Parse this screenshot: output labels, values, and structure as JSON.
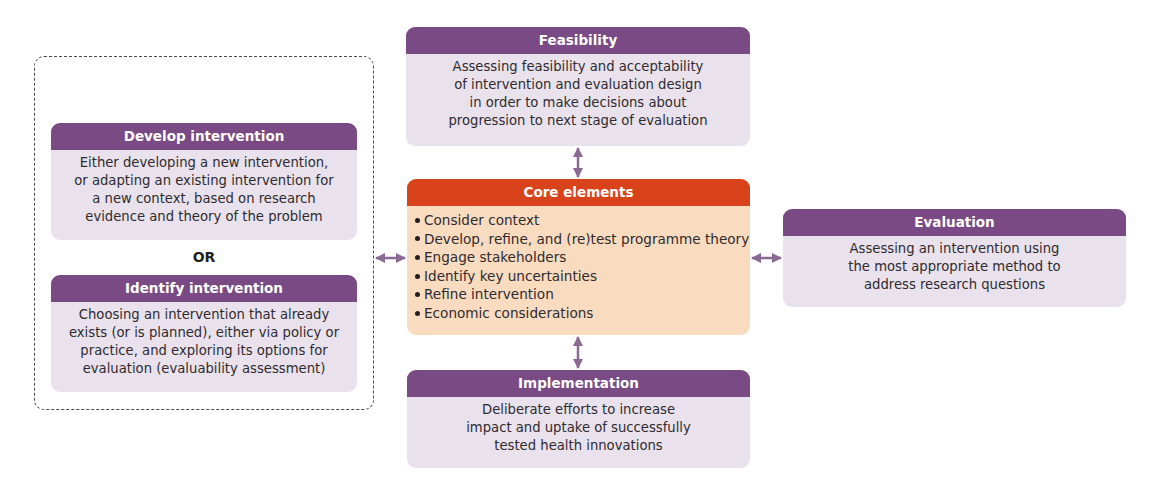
{
  "diagram": {
    "colors": {
      "header_purple": "#7a4a84",
      "box_lilac": "#e9e2ec",
      "core_header_orange": "#d9431c",
      "core_body_peach": "#f9dcc0",
      "arrow_purple": "#8a6a93",
      "dashed_border": "#4a4a4a"
    },
    "feasibility": {
      "title": "Feasibility",
      "lines": [
        "Assessing feasibility and acceptability",
        "of intervention and evaluation design",
        "in order to make decisions about",
        "progression to next stage of evaluation"
      ]
    },
    "develop": {
      "title": "Develop intervention",
      "lines": [
        "Either developing a new intervention,",
        "or adapting an existing intervention for",
        "a new context, based on research",
        "evidence and theory of the problem"
      ]
    },
    "or_label": "OR",
    "identify": {
      "title": "Identify intervention",
      "lines": [
        "Choosing an intervention that already",
        "exists (or is planned), either via policy or",
        "practice, and exploring its options for",
        "evaluation (evaluability assessment)"
      ]
    },
    "core": {
      "title": "Core elements",
      "items": [
        "Consider context",
        "Develop, refine, and (re)test programme theory",
        "Engage stakeholders",
        "Identify key uncertainties",
        "Refine intervention",
        "Economic considerations"
      ]
    },
    "evaluation": {
      "title": "Evaluation",
      "lines": [
        "Assessing an intervention using",
        "the most appropriate method to",
        "address research questions"
      ]
    },
    "implementation": {
      "title": "Implementation",
      "lines": [
        "Deliberate efforts to increase",
        "impact and uptake of successfully",
        "tested health innovations"
      ]
    },
    "connectors": [
      {
        "from": "feasibility",
        "to": "core",
        "type": "bidirectional-arrow"
      },
      {
        "from": "core",
        "to": "implementation",
        "type": "bidirectional-arrow"
      },
      {
        "from": "develop-identify-group",
        "to": "core",
        "type": "bidirectional-arrow"
      },
      {
        "from": "core",
        "to": "evaluation",
        "type": "bidirectional-arrow"
      }
    ]
  }
}
